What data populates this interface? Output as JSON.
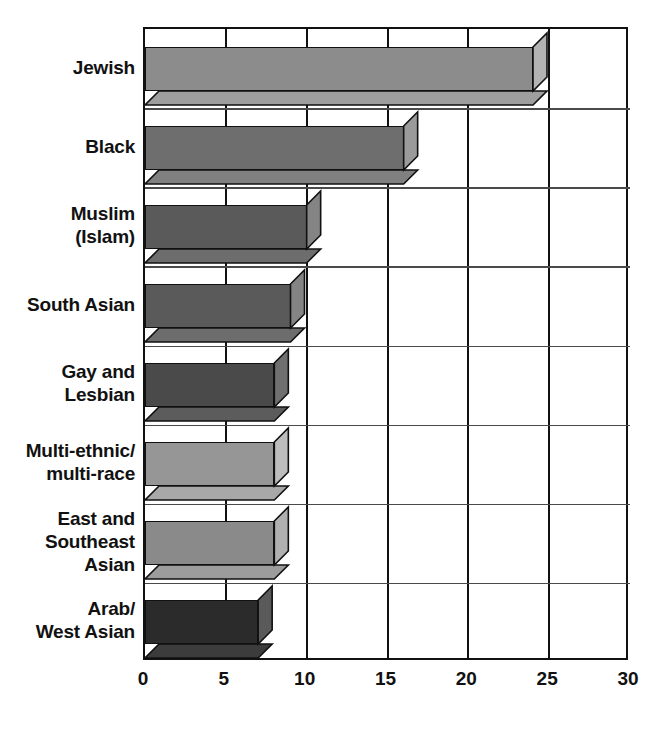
{
  "chart_data": {
    "type": "bar",
    "orientation": "horizontal",
    "title": "",
    "subtitle": "",
    "xlabel": "",
    "ylabel": "",
    "xlim": [
      0,
      30
    ],
    "ylim": null,
    "grid": true,
    "legend": null,
    "xticks": [
      "0",
      "5",
      "10",
      "15",
      "20",
      "25",
      "30"
    ],
    "xtick_values": [
      0,
      5,
      10,
      15,
      20,
      25,
      30
    ],
    "categories": [
      "Jewish",
      "Black",
      "Muslim\n(Islam)",
      "South Asian",
      "Gay and\nLesbian",
      "Multi-ethnic/\nmulti-race",
      "East and\nSoutheast\nAsian",
      "Arab/\nWest Asian"
    ],
    "values": [
      24,
      16,
      10,
      9,
      8,
      8,
      8,
      7
    ],
    "bar_colors": [
      "#8c8c8c",
      "#6e6e6e",
      "#5a5a5a",
      "#5a5a5a",
      "#4a4a4a",
      "#969696",
      "#8a8a8a",
      "#2b2b2b"
    ],
    "bar_side_colors": [
      "#b4b4b4",
      "#9a9a9a",
      "#848484",
      "#848484",
      "#6f6f6f",
      "#bdbdbd",
      "#b0b0b0",
      "#5a5a5a"
    ],
    "bar_bottom_colors": [
      "#9e9e9e",
      "#808080",
      "#6d6d6d",
      "#6d6d6d",
      "#5c5c5c",
      "#a8a8a8",
      "#9c9c9c",
      "#3c3c3c"
    ],
    "axis_color": "#111111",
    "grid_color": "#111111",
    "background": "#ffffff"
  },
  "bottom_caption": ""
}
